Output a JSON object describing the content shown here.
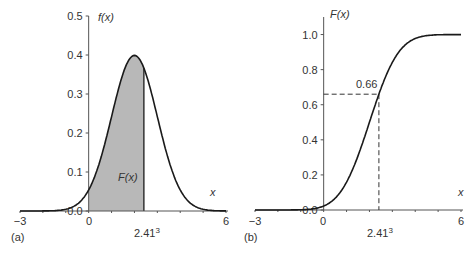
{
  "chart_data": [
    {
      "panel": "(a)",
      "type": "area",
      "title": "",
      "description": "Normal probability density function f(x) with mean 2 and sd 1; area to the left of x = 2.413 shaded and labelled F(x)",
      "xlabel": "x",
      "ylabel": "f(x)",
      "xlim": [
        -3,
        6
      ],
      "ylim": [
        0.0,
        0.5
      ],
      "x_tick_labels": [
        "-3",
        "0",
        "6"
      ],
      "x_marker_label": "2.41³",
      "x_marker_value": 2.413,
      "y_ticks": [
        0.0,
        0.1,
        0.2,
        0.3,
        0.4,
        0.5
      ],
      "y_tick_labels": [
        "0.0",
        "0.1",
        "0.2",
        "0.3",
        "0.4",
        "0.5"
      ],
      "distribution": {
        "mean": 2,
        "sd": 1
      },
      "peak": {
        "x": 2,
        "y": 0.399
      },
      "shaded_region": {
        "from": 0,
        "to": 2.413,
        "label": "F(x)",
        "color": "#b8b8b8"
      },
      "grid": false,
      "legend": null
    },
    {
      "panel": "(b)",
      "type": "line",
      "title": "",
      "description": "Cumulative distribution function F(x) for the same normal distribution; dashed lines mark F(2.413) = 0.66",
      "xlabel": "x",
      "ylabel": "F(x)",
      "xlim": [
        -3,
        6
      ],
      "ylim": [
        0.0,
        1.1
      ],
      "x_tick_labels": [
        "-3",
        "0",
        "6"
      ],
      "x_marker_label": "2.41³",
      "x_marker_value": 2.413,
      "y_ticks": [
        0.0,
        0.2,
        0.4,
        0.6,
        0.8,
        1.0
      ],
      "y_tick_labels": [
        "0.0",
        "0.2",
        "0.4",
        "0.6",
        "0.8",
        "1.0"
      ],
      "distribution": {
        "mean": 2,
        "sd": 1
      },
      "annotation": {
        "x": 2.413,
        "y": 0.66,
        "label": "0.66",
        "style": "dashed"
      },
      "grid": false,
      "legend": null
    }
  ],
  "labels": {
    "panel_a": "(a)",
    "panel_b": "(b)",
    "fx": "f(x)",
    "Fx": "F(x)",
    "x": "x",
    "shaded": "F(x)",
    "marker": "2.41",
    "marker_sup": "3",
    "annot": "0.66",
    "xt_min": "−3",
    "xt_zero": "0",
    "xt_max": "6"
  },
  "colors": {
    "line": "#1a1a1a",
    "axis": "#555555",
    "shade": "#b8b8b8"
  }
}
